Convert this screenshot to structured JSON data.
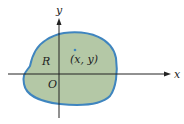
{
  "diagram": {
    "axes": {
      "x_label": "x",
      "y_label": "y",
      "origin_label": "O"
    },
    "region_label": "R",
    "point_label": "(x, y)",
    "colors": {
      "fill": "#b4c8a6",
      "stroke": "#3f85bf",
      "axis": "#222222"
    }
  }
}
